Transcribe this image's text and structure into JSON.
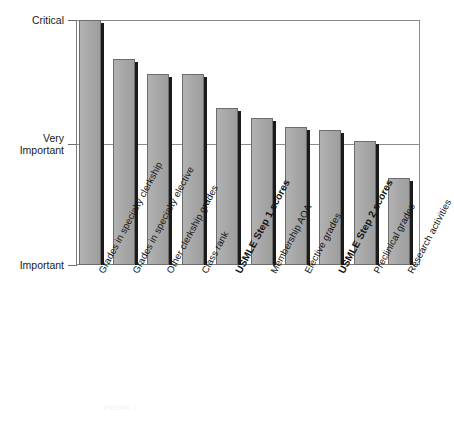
{
  "chart_data": {
    "type": "bar",
    "title": "",
    "xlabel": "",
    "ylabel": "",
    "grid": true,
    "legend_position": "none",
    "ylim": [
      0,
      2
    ],
    "ytick_labels": [
      "Important",
      "Very\nImportant",
      "Critical"
    ],
    "ytick_values": [
      0,
      1,
      2
    ],
    "categories": [
      "Grades in specialty clerkship",
      "Grades in specialty elective",
      "Other clerkship grades",
      "Class rank",
      "USMLE Step 1 scores",
      "Membership AOA",
      "Elective grades",
      "USMLE Step 2 scores",
      "Preclinical grades",
      "Research activities"
    ],
    "values": [
      2.0,
      1.68,
      1.56,
      1.56,
      1.28,
      1.2,
      1.13,
      1.1,
      1.01,
      0.71
    ],
    "emphasized_categories": [
      "USMLE Step 1 scores",
      "USMLE Step 2 scores"
    ],
    "bar_color": "#a9a9a9",
    "bar_edge_color": "#6d6d6d",
    "bar_shadow_color": "#1b1b1b",
    "axis_color": "#7d7d7d",
    "gridline_color": "#8d8d8d"
  },
  "caption": {
    "text": "FIGURE 1"
  }
}
